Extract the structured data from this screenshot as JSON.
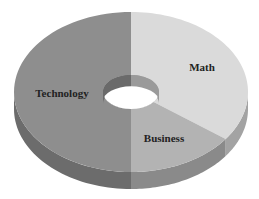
{
  "chart_data": {
    "type": "pie",
    "subtype": "3d-donut",
    "title": "",
    "categories": [
      "Math",
      "Business",
      "Technology"
    ],
    "values": [
      35,
      15,
      50
    ],
    "unit": "%",
    "start_angle_deg": 0,
    "direction": "clockwise",
    "legend": "none",
    "labels_on_slices": true,
    "colors": {
      "Math": {
        "top": "#dadada",
        "side": "#a3a3a3"
      },
      "Business": {
        "top": "#b3b3b3",
        "side": "#8a8a8a"
      },
      "Technology": {
        "top": "#8e8e8e",
        "side": "#6c6c6c"
      }
    },
    "hole_colors": {
      "inner_left": "#6a6a6a",
      "inner_right": "#9a9a9a",
      "center": "#ffffff"
    }
  },
  "labels": {
    "math": "Math",
    "business": "Business",
    "technology": "Technology"
  }
}
